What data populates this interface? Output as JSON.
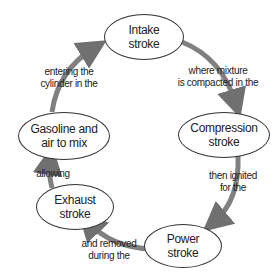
{
  "diagram": {
    "type": "cycle",
    "nodes": [
      {
        "id": "intake",
        "label": "Intake\nstroke",
        "line1": "Intake",
        "line2": "stroke"
      },
      {
        "id": "compression",
        "label": "Compression\nstroke",
        "line1": "Compression",
        "line2": "stroke"
      },
      {
        "id": "power",
        "label": "Power\nstroke",
        "line1": "Power",
        "line2": "stroke"
      },
      {
        "id": "exhaust",
        "label": "Exhaust\nstroke",
        "line1": "Exhaust",
        "line2": "stroke"
      },
      {
        "id": "gasoline",
        "label": "Gasoline and\nair to mix",
        "line1": "Gasoline and",
        "line2": "air to mix"
      }
    ],
    "edges": [
      {
        "from": "intake",
        "to": "compression",
        "line1": "where mixture",
        "line2": "is compacted in the"
      },
      {
        "from": "compression",
        "to": "power",
        "line1": "then ignited",
        "line2": "for the"
      },
      {
        "from": "power",
        "to": "exhaust",
        "line1": "and removed",
        "line2": "during the"
      },
      {
        "from": "exhaust",
        "to": "gasoline",
        "line1": "allowing",
        "line2": ""
      },
      {
        "from": "gasoline",
        "to": "intake",
        "line1": "entering the",
        "line2": "cylinder in the"
      }
    ],
    "arrow_color": "#7a7a7a"
  }
}
